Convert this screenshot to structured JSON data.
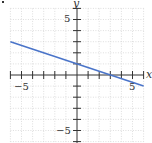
{
  "chart_data": {
    "type": "line",
    "title": "",
    "xlabel": "x",
    "ylabel": "y",
    "xlim": [
      -6,
      6
    ],
    "ylim": [
      -6,
      6
    ],
    "grid": true,
    "x_tick_labels": [
      "-5",
      "5"
    ],
    "y_tick_labels": [
      "5",
      "-5"
    ],
    "series": [
      {
        "name": "line",
        "equation": "y = -x/3 + 1",
        "color": "#4a74c9",
        "x": [
          -6,
          6
        ],
        "y": [
          3,
          -1
        ]
      }
    ]
  },
  "labels": {
    "x_axis": "x",
    "y_axis": "y",
    "x_neg5": "−5",
    "x_pos5": "5",
    "y_pos5": "5",
    "y_neg5": "−5"
  },
  "colors": {
    "grid": "#c8c8c8",
    "axis": "#333333",
    "line": "#4a74c9"
  }
}
